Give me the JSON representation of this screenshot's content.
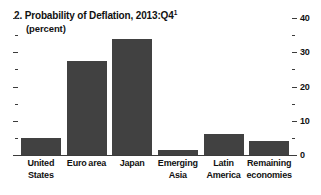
{
  "chart_data": {
    "type": "bar",
    "title": "2. Probability of Deflation, 2013:Q4",
    "title_number": "2.",
    "title_footnote_marker": "1",
    "subtitle": "(percent)",
    "categories": [
      "United States",
      "Euro area",
      "Japan",
      "Emerging Asia",
      "Latin America",
      "Remaining economies"
    ],
    "values": [
      5,
      27.5,
      34,
      1.5,
      6,
      4
    ],
    "xlabel": "",
    "ylabel": "",
    "ylim": [
      0,
      40
    ],
    "y_ticks_major": [
      0,
      10,
      20,
      30,
      40
    ],
    "y_ticks_major_labels": [
      "0",
      "10",
      "20",
      "30",
      "40"
    ],
    "y_ticks_minor": [
      5,
      15,
      25,
      35
    ],
    "axis_position": "right",
    "grid": false,
    "legend": "none",
    "bar_color": "#414141",
    "axis_color": "#3b3b3b",
    "background_color": "#ffffff"
  }
}
